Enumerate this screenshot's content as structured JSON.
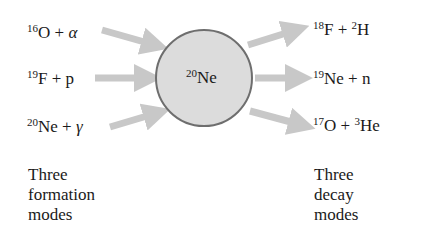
{
  "center": {
    "mass": "20",
    "symbol": "Ne",
    "fill": "#dcdcdc",
    "stroke": "#6e6e6e"
  },
  "arrow_color": "#c8c8c8",
  "formation_modes": [
    {
      "mass": "16",
      "symbol": "O",
      "plus": " + ",
      "particle": "α"
    },
    {
      "mass": "19",
      "symbol": "F",
      "plus": " + ",
      "particle": "p"
    },
    {
      "mass": "20",
      "symbol": "Ne",
      "plus": " + ",
      "particle": "γ"
    }
  ],
  "decay_modes": [
    {
      "mass": "18",
      "symbol": "F",
      "plus": " + ",
      "p_mass": "2",
      "particle": "H"
    },
    {
      "mass": "19",
      "symbol": "Ne",
      "plus": " + ",
      "p_mass": "",
      "particle": "n"
    },
    {
      "mass": "17",
      "symbol": "O",
      "plus": " + ",
      "p_mass": "3",
      "particle": "He"
    }
  ],
  "captions": {
    "left": [
      "Three",
      "formation",
      "modes"
    ],
    "right": [
      "Three",
      "decay",
      "modes"
    ]
  }
}
